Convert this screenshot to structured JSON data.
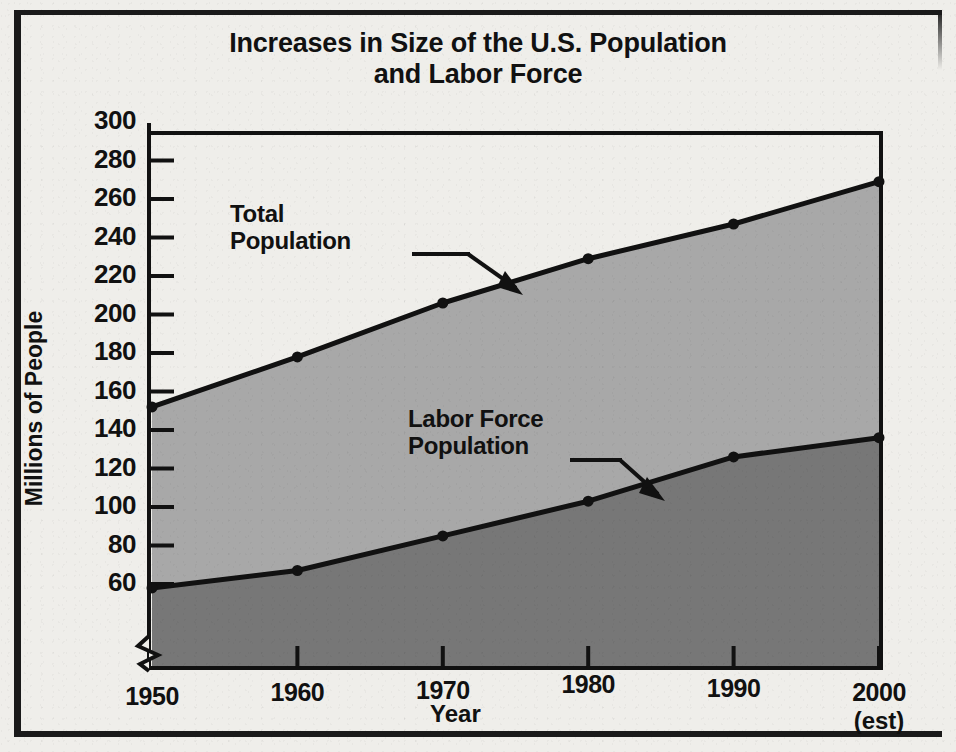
{
  "chart_data": {
    "type": "area",
    "title": "Increases in Size of the U.S. Population and Labor Force",
    "title_line1": "Increases in Size of the U.S. Population",
    "title_line2": "and Labor Force",
    "xlabel": "Year",
    "ylabel": "Millions of People",
    "x": [
      1950,
      1960,
      1970,
      1980,
      1990,
      2000
    ],
    "categories": [
      "1950",
      "1960",
      "1970",
      "1980",
      "1990",
      "2000"
    ],
    "x_tick_sublabels": [
      "",
      "",
      "",
      "",
      "",
      "(est)"
    ],
    "ylim": [
      40,
      300
    ],
    "y_ticks": [
      60,
      80,
      100,
      120,
      140,
      160,
      180,
      200,
      220,
      240,
      260,
      280,
      300
    ],
    "y_tick_labels": [
      "60",
      "80",
      "100",
      "120",
      "140",
      "160",
      "180",
      "200",
      "220",
      "240",
      "260",
      "280",
      "300"
    ],
    "y_axis_break": true,
    "grid": false,
    "legend": "annotations",
    "series": [
      {
        "name": "Total Population",
        "annotation_line1": "Total",
        "annotation_line2": "Population",
        "values": [
          152,
          178,
          206,
          229,
          247,
          269
        ],
        "fill_color": "#a8a8a8",
        "line_color": "#111111"
      },
      {
        "name": "Labor Force Population",
        "annotation_line1": "Labor Force",
        "annotation_line2": "Population",
        "values": [
          58,
          67,
          85,
          103,
          126,
          136
        ],
        "fill_color": "#777777",
        "line_color": "#111111"
      }
    ]
  },
  "figure": {
    "background_color": "#efeeea",
    "frame_color": "#1a1a1a",
    "text_color": "#111111"
  }
}
